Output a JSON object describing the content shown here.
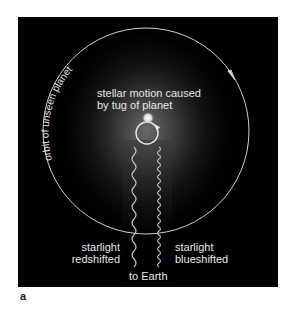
{
  "figure": {
    "panel_label": "a",
    "orbit_label": "orbit of unseen planet",
    "stellar_motion_label": [
      "stellar motion caused",
      "by tug of planet"
    ],
    "red_label": [
      "starlight",
      "redshifted"
    ],
    "blue_label": [
      "starlight",
      "blueshifted"
    ],
    "earth_label": "to Earth"
  },
  "colors": {
    "background": "#000000",
    "line": "#cfcfcf",
    "text": "#e6e6e6",
    "glow": "#5a5a5a"
  }
}
